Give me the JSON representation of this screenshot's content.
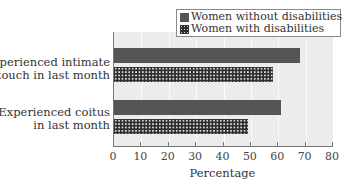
{
  "chart_data": {
    "type": "bar",
    "orientation": "horizontal",
    "title": "",
    "xlabel": "Percentage",
    "ylabel": "",
    "xlim": [
      0,
      80
    ],
    "xticks": [
      0,
      10,
      20,
      30,
      40,
      50,
      60,
      70,
      80
    ],
    "categories": [
      "Experienced intimate touch in last month",
      "Experienced coitus in last month"
    ],
    "category_lines": [
      [
        "Experienced intimate",
        "touch in last month"
      ],
      [
        "Experienced coitus",
        "in last month"
      ]
    ],
    "series": [
      {
        "name": "Women without disabilities",
        "pattern": "solid",
        "color": "#555555",
        "values": [
          68,
          61
        ]
      },
      {
        "name": "Women with disabilities",
        "pattern": "dotted",
        "color": "#2e2e2e",
        "values": [
          58,
          49
        ]
      }
    ],
    "grid": true,
    "legend_position": "top-right"
  },
  "legend": {
    "items": [
      {
        "label": "Women without disabilities"
      },
      {
        "label": "Women with disabilities"
      }
    ]
  },
  "axis": {
    "xlabel": "Percentage",
    "ticks": [
      "0",
      "10",
      "20",
      "30",
      "40",
      "50",
      "60",
      "70",
      "80"
    ]
  },
  "categories": [
    {
      "line1": "Experienced intimate",
      "line2": "touch in last month"
    },
    {
      "line1": "Experienced coitus",
      "line2": "in last month"
    }
  ]
}
